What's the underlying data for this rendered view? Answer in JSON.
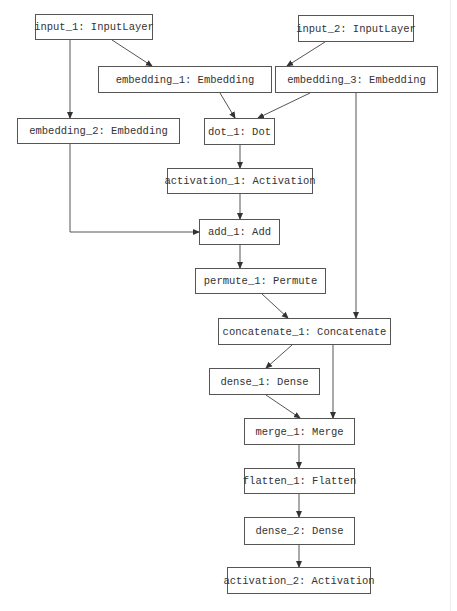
{
  "diagram": {
    "type": "keras-model-graph",
    "colors": {
      "background": "#ffffff",
      "stroke": "#555555",
      "text": "#333333"
    },
    "nodes": [
      {
        "id": "input_1",
        "label": "input_1: InputLayer",
        "x": 35,
        "y": 14,
        "w": 118,
        "h": 26
      },
      {
        "id": "input_2",
        "label": "input_2: InputLayer",
        "x": 298,
        "y": 15,
        "w": 116,
        "h": 27
      },
      {
        "id": "embedding_1",
        "label": "embedding_1: Embedding",
        "x": 98,
        "y": 66,
        "w": 174,
        "h": 27
      },
      {
        "id": "embedding_3",
        "label": "embedding_3: Embedding",
        "x": 275,
        "y": 66,
        "w": 163,
        "h": 27
      },
      {
        "id": "embedding_2",
        "label": "embedding_2: Embedding",
        "x": 17,
        "y": 118,
        "w": 163,
        "h": 26
      },
      {
        "id": "dot_1",
        "label": "dot_1: Dot",
        "x": 204,
        "y": 118,
        "w": 71,
        "h": 27
      },
      {
        "id": "activation_1",
        "label": "activation_1: Activation",
        "x": 167,
        "y": 168,
        "w": 146,
        "h": 26
      },
      {
        "id": "add_1",
        "label": "add_1: Add",
        "x": 199,
        "y": 219,
        "w": 81,
        "h": 26
      },
      {
        "id": "permute_1",
        "label": "permute_1: Permute",
        "x": 195,
        "y": 268,
        "w": 131,
        "h": 26
      },
      {
        "id": "concatenate_1",
        "label": "concatenate_1: Concatenate",
        "x": 218,
        "y": 318,
        "w": 173,
        "h": 27
      },
      {
        "id": "dense_1",
        "label": "dense_1: Dense",
        "x": 209,
        "y": 368,
        "w": 111,
        "h": 27
      },
      {
        "id": "merge_1",
        "label": "merge_1: Merge",
        "x": 244,
        "y": 418,
        "w": 111,
        "h": 27
      },
      {
        "id": "flatten_1",
        "label": "flatten_1: Flatten",
        "x": 244,
        "y": 468,
        "w": 111,
        "h": 26
      },
      {
        "id": "dense_2",
        "label": "dense_2: Dense",
        "x": 244,
        "y": 517,
        "w": 111,
        "h": 28
      },
      {
        "id": "activation_2",
        "label": "activation_2: Activation",
        "x": 227,
        "y": 567,
        "w": 144,
        "h": 27
      }
    ],
    "edges": [
      {
        "from": "input_1",
        "to": "embedding_1",
        "points": [
          [
            112,
            40
          ],
          [
            152,
            66
          ]
        ]
      },
      {
        "from": "input_1",
        "to": "embedding_2",
        "points": [
          [
            70,
            40
          ],
          [
            70,
            118
          ]
        ]
      },
      {
        "from": "input_2",
        "to": "embedding_3",
        "points": [
          [
            325,
            42
          ],
          [
            287,
            66
          ]
        ]
      },
      {
        "from": "embedding_1",
        "to": "dot_1",
        "points": [
          [
            220,
            93
          ],
          [
            235,
            118
          ]
        ]
      },
      {
        "from": "embedding_3",
        "to": "dot_1",
        "points": [
          [
            310,
            93
          ],
          [
            258,
            118
          ]
        ]
      },
      {
        "from": "embedding_3",
        "to": "concatenate_1",
        "points": [
          [
            356,
            93
          ],
          [
            356,
            318
          ]
        ]
      },
      {
        "from": "dot_1",
        "to": "activation_1",
        "points": [
          [
            240,
            145
          ],
          [
            240,
            168
          ]
        ]
      },
      {
        "from": "embedding_2",
        "to": "add_1",
        "points": [
          [
            70,
            144
          ],
          [
            70,
            232
          ],
          [
            199,
            232
          ]
        ]
      },
      {
        "from": "activation_1",
        "to": "add_1",
        "points": [
          [
            240,
            194
          ],
          [
            240,
            219
          ]
        ]
      },
      {
        "from": "add_1",
        "to": "permute_1",
        "points": [
          [
            240,
            245
          ],
          [
            240,
            268
          ]
        ]
      },
      {
        "from": "permute_1",
        "to": "concatenate_1",
        "points": [
          [
            262,
            294
          ],
          [
            288,
            318
          ]
        ]
      },
      {
        "from": "concatenate_1",
        "to": "dense_1",
        "points": [
          [
            292,
            345
          ],
          [
            266,
            368
          ]
        ]
      },
      {
        "from": "concatenate_1",
        "to": "merge_1",
        "points": [
          [
            333,
            345
          ],
          [
            333,
            418
          ]
        ]
      },
      {
        "from": "dense_1",
        "to": "merge_1",
        "points": [
          [
            266,
            395
          ],
          [
            300,
            418
          ]
        ]
      },
      {
        "from": "merge_1",
        "to": "flatten_1",
        "points": [
          [
            299,
            445
          ],
          [
            299,
            468
          ]
        ]
      },
      {
        "from": "flatten_1",
        "to": "dense_2",
        "points": [
          [
            299,
            494
          ],
          [
            299,
            517
          ]
        ]
      },
      {
        "from": "dense_2",
        "to": "activation_2",
        "points": [
          [
            299,
            545
          ],
          [
            299,
            567
          ]
        ]
      }
    ]
  }
}
